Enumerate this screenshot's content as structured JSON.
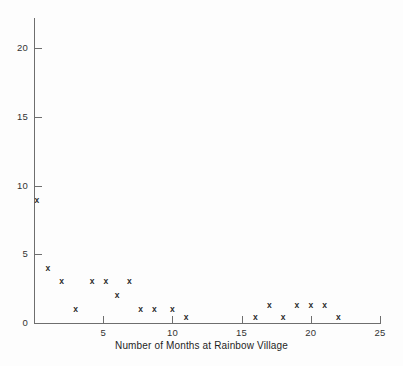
{
  "chart_data": {
    "type": "scatter",
    "title": "",
    "xlabel": "Number of Months at Rainbow Village",
    "ylabel": "",
    "xlim": [
      0,
      25
    ],
    "ylim": [
      0,
      22
    ],
    "xticks": [
      5,
      10,
      15,
      20,
      25
    ],
    "yticks": [
      0,
      5,
      10,
      15,
      20
    ],
    "xtick_labels": [
      "5",
      "10",
      "15",
      "20",
      "25"
    ],
    "ytick_labels": [
      "0",
      "5",
      "10",
      "15",
      "20"
    ],
    "grid": false,
    "legend": null,
    "marker": "x",
    "marker_glyph": "x",
    "marker_color": "#2b2b2b",
    "axis_color": "#6e6e6e",
    "background_color": "#fdfdfd",
    "points": [
      {
        "x": 0.2,
        "y": 8.9
      },
      {
        "x": 1.0,
        "y": 4.0
      },
      {
        "x": 2.0,
        "y": 3.0
      },
      {
        "x": 3.0,
        "y": 1.0
      },
      {
        "x": 4.2,
        "y": 3.0
      },
      {
        "x": 5.2,
        "y": 3.0
      },
      {
        "x": 6.0,
        "y": 2.0
      },
      {
        "x": 6.9,
        "y": 3.0
      },
      {
        "x": 7.7,
        "y": 1.0
      },
      {
        "x": 8.7,
        "y": 1.0
      },
      {
        "x": 10.0,
        "y": 1.0
      },
      {
        "x": 11.0,
        "y": 0.4
      },
      {
        "x": 16.0,
        "y": 0.4
      },
      {
        "x": 17.0,
        "y": 1.3
      },
      {
        "x": 18.0,
        "y": 0.4
      },
      {
        "x": 19.0,
        "y": 1.3
      },
      {
        "x": 20.0,
        "y": 1.3
      },
      {
        "x": 21.0,
        "y": 1.3
      },
      {
        "x": 22.0,
        "y": 0.4
      }
    ]
  },
  "axes": {
    "x_title": "Number of Months at Rainbow Village"
  }
}
